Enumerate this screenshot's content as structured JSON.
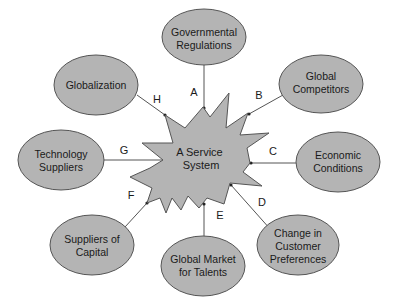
{
  "diagram": {
    "center": {
      "label_lines": [
        "A Service",
        "System"
      ]
    },
    "colors": {
      "fill": "#b4b4b4",
      "stroke": "#555555",
      "text": "#1a1a1a",
      "background": "#ffffff"
    },
    "nodes": [
      {
        "id": "A",
        "label_lines": [
          "Governmental",
          "Regulations"
        ],
        "edge_label": "A"
      },
      {
        "id": "B",
        "label_lines": [
          "Global",
          "Competitors"
        ],
        "edge_label": "B"
      },
      {
        "id": "C",
        "label_lines": [
          "Economic",
          "Conditions"
        ],
        "edge_label": "C"
      },
      {
        "id": "D",
        "label_lines": [
          "Change in",
          "Customer",
          "Preferences"
        ],
        "edge_label": "D"
      },
      {
        "id": "E",
        "label_lines": [
          "Global Market",
          "for Talents"
        ],
        "edge_label": "E"
      },
      {
        "id": "F",
        "label_lines": [
          "Suppliers of",
          "Capital"
        ],
        "edge_label": "F"
      },
      {
        "id": "G",
        "label_lines": [
          "Technology",
          "Suppliers"
        ],
        "edge_label": "G"
      },
      {
        "id": "H",
        "label_lines": [
          "Globalization"
        ],
        "edge_label": "H"
      }
    ]
  }
}
